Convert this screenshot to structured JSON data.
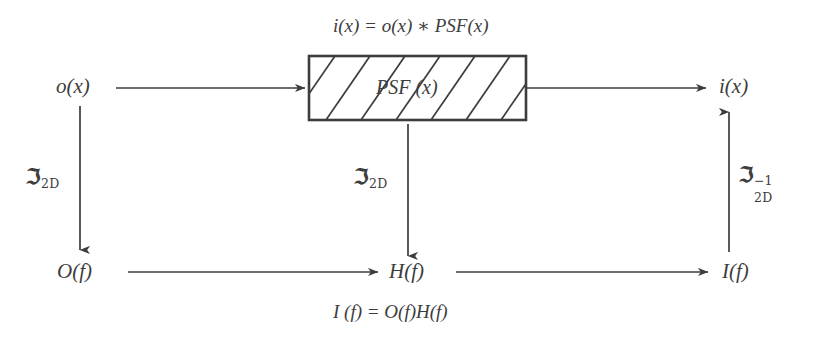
{
  "diagram": {
    "background_color": "#ffffff",
    "ink_color": "#3d3d3d",
    "equations": {
      "top": "i(x) = o(x) ∗ PSF(x)",
      "bottom": "I (f) = O(f)H(f)"
    },
    "nodes": {
      "object_spatial": "o(x)",
      "image_spatial": "i(x)",
      "object_spectrum": "O(f)",
      "transfer_function": "H(f)",
      "image_spectrum": "I(f)"
    },
    "block": {
      "label": "PSF (x)",
      "fill_pattern": "diagonal-hatch",
      "hatch_line_count": 7,
      "border_color": "#3d3d3d"
    },
    "transforms": {
      "forward_symbol": "ℑ",
      "forward_subscript": "2D",
      "inverse_symbol": "ℑ",
      "inverse_subscript": "2D",
      "inverse_superscript": "−1",
      "left_label": "ℑ 2D",
      "center_label": "ℑ 2D",
      "right_label": "ℑ 2D −1"
    },
    "arrows": {
      "object_to_block": "horizontal-right",
      "block_to_image": "horizontal-right",
      "object_to_spectrum": "vertical-down",
      "block_to_transfer": "vertical-down",
      "spectrum_to_transfer": "horizontal-right",
      "transfer_to_image_spectrum": "horizontal-right",
      "image_spectrum_to_image": "vertical-up"
    }
  }
}
